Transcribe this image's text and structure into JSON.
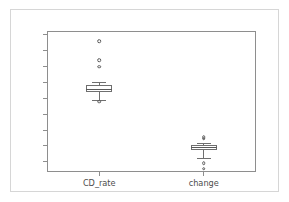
{
  "figure": {
    "title": "",
    "background_color": "#ffffff",
    "border_color": "#d6d6d6",
    "axis_color": "#8e8e8e",
    "artist_color": "#6f6f6f"
  },
  "chart_data": {
    "type": "box",
    "title": "",
    "xlabel": "",
    "ylabel": "",
    "categories": [
      "CD_rate",
      "change"
    ],
    "ylim": [
      -0.82,
      3.62
    ],
    "ytick_labels": [
      "-0.5",
      "0.0",
      "0.5",
      "1.0",
      "1.5",
      "2.0",
      "2.5",
      "3.0",
      "3.5"
    ],
    "ytick_values": [
      -0.5,
      0.0,
      0.5,
      1.0,
      1.5,
      2.0,
      2.5,
      3.0,
      3.5
    ],
    "grid": false,
    "legend": false,
    "series": [
      {
        "name": "CD_rate",
        "x_position": 0.25,
        "q1": 1.7,
        "median": 1.79,
        "q3": 1.92,
        "whisker_low": 1.45,
        "whisker_high": 2.0,
        "fliers": [
          3.3,
          2.7,
          2.5,
          1.4
        ]
      },
      {
        "name": "change",
        "x_position": 0.75,
        "q1": -0.12,
        "median": -0.04,
        "q3": 0.04,
        "whisker_low": -0.37,
        "whisker_high": 0.08,
        "fliers": [
          0.28,
          0.23,
          -0.55,
          -0.72
        ]
      }
    ]
  }
}
